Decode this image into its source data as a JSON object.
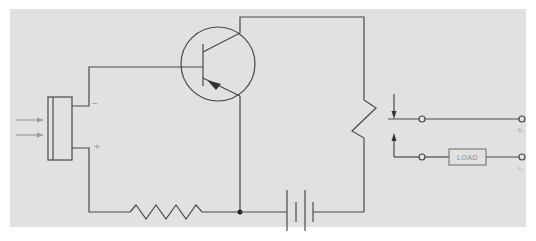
{
  "diagram": {
    "type": "photocell-transistor-relay-circuit",
    "colors": {
      "background": "#ffffff",
      "panel": "#e1e1e1",
      "line": "#4a4a4a",
      "light_line": "#9a9a9a"
    },
    "photocell": {
      "negative_label": "−",
      "positive_label": "+",
      "light_rays": 2
    },
    "transistor": {
      "kind": "NPN",
      "terminals": [
        "base",
        "collector",
        "emitter"
      ]
    },
    "components": {
      "series_resistor": "resistor",
      "battery": "battery",
      "variable_resistor": "relay-coil / variable resistor",
      "switch": "relay contacts"
    },
    "load": {
      "label": "LOAD"
    },
    "terminals": {
      "top_label": "E₁",
      "bottom_label": "L₁"
    }
  }
}
